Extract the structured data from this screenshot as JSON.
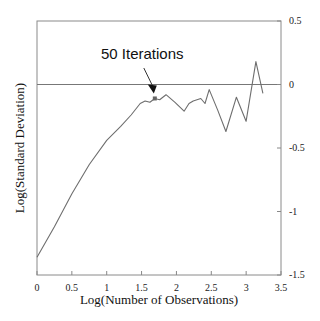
{
  "chart_data": {
    "type": "line",
    "title": "",
    "xlabel": "Log(Number of Observations)",
    "ylabel": "Log(Standard Deviation)",
    "xlim": [
      0,
      3.5
    ],
    "ylim": [
      -1.5,
      0.5
    ],
    "x_ticks": [
      "0",
      "0.5",
      "1",
      "1.5",
      "2",
      "2.5",
      "3",
      "3.5"
    ],
    "y_ticks": [
      "0.5",
      "0",
      "-0.5",
      "-1",
      "-1.5"
    ],
    "y_axis_position": "right",
    "grid": false,
    "reference_line": {
      "y": 0
    },
    "annotation": {
      "text": "50 Iterations",
      "x": 1.69,
      "y": -0.11
    },
    "series": [
      {
        "name": "Log(Standard Deviation)",
        "x": [
          0.0,
          0.25,
          0.5,
          0.75,
          1.0,
          1.2,
          1.35,
          1.48,
          1.55,
          1.62,
          1.69,
          1.76,
          1.85,
          1.98,
          2.11,
          2.18,
          2.24,
          2.35,
          2.41,
          2.47,
          2.59,
          2.71,
          2.86,
          3.0,
          3.14,
          3.24
        ],
        "values": [
          -1.36,
          -1.12,
          -0.86,
          -0.63,
          -0.44,
          -0.33,
          -0.24,
          -0.15,
          -0.13,
          -0.14,
          -0.11,
          -0.12,
          -0.08,
          -0.14,
          -0.21,
          -0.15,
          -0.13,
          -0.11,
          -0.15,
          -0.04,
          -0.2,
          -0.37,
          -0.1,
          -0.29,
          0.18,
          -0.07
        ]
      }
    ]
  }
}
